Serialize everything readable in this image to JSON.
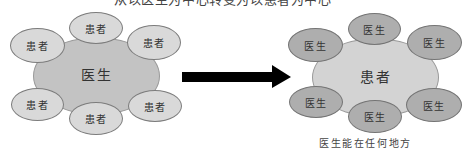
{
  "title": "从以医生为中心转变为以患者为中心",
  "left_diagram": {
    "center": "医生",
    "satellites": [
      "患者",
      "患者",
      "患者",
      "患者",
      "患者",
      "患者"
    ]
  },
  "arrow": {
    "direction": "right",
    "color": "#000000"
  },
  "right_diagram": {
    "center": "患者",
    "satellites": [
      "医生",
      "医生",
      "医生",
      "医生",
      "医生",
      "医生"
    ],
    "caption": "医生能在任何地方"
  },
  "colors": {
    "left_center_fill": "#c3c3c3",
    "left_satellite_fill": "#d9d9d9",
    "right_center_fill": "#d3d3d3",
    "right_satellite_fill": "#aeaeae",
    "outline": "#7c7c7c",
    "arrow": "#000000"
  }
}
